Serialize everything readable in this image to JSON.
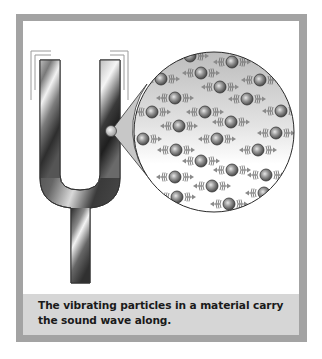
{
  "figure": {
    "caption": "The vibrating particles in a material carry the sound wave along.",
    "illustration": {
      "subject": "tuning-fork",
      "magnified_view": "vibrating-particles",
      "particle_count": 25
    }
  },
  "colors": {
    "frame_border": "#a3a3a3",
    "caption_background": "#d6d6d6",
    "caption_text": "#1a1a1a",
    "fork_dark": "#2b2b2b",
    "fork_light": "#f0f0f0",
    "particle": "#8a8a8a",
    "arrow": "#7a7a7a"
  }
}
